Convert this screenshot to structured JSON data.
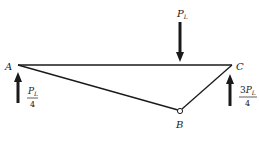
{
  "diagram": {
    "nodes": [
      {
        "id": "A",
        "label": "A"
      },
      {
        "id": "B",
        "label": "B"
      },
      {
        "id": "C",
        "label": "C"
      }
    ],
    "members": [
      {
        "from": "A",
        "to": "C"
      },
      {
        "from": "A",
        "to": "B"
      },
      {
        "from": "B",
        "to": "C"
      }
    ],
    "loads": {
      "applied": {
        "symbol": "P",
        "subscript": "L",
        "direction": "down"
      },
      "reaction_A": {
        "numerator_symbol": "P",
        "numerator_subscript": "L",
        "denominator": "4",
        "direction": "up"
      },
      "reaction_C": {
        "coefficient": "3",
        "numerator_symbol": "P",
        "numerator_subscript": "L",
        "denominator": "4",
        "direction": "up"
      }
    },
    "colors": {
      "line": "#1a1a1a",
      "background": "#ffffff"
    }
  }
}
